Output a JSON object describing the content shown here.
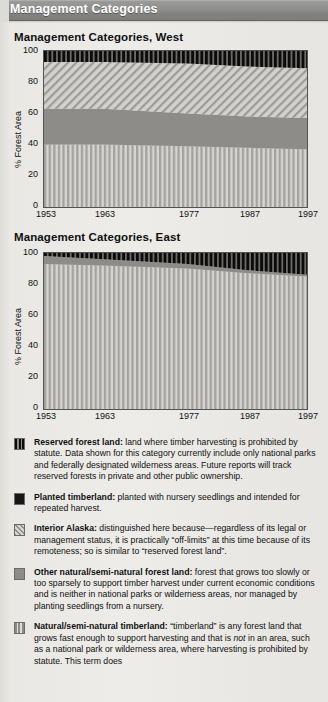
{
  "header": {
    "title": "Management Categories"
  },
  "charts": [
    {
      "id": "west",
      "title": "Management Categories, West",
      "ylabel": "% Forest Area",
      "yticks": [
        "100",
        "80",
        "60",
        "40",
        "20",
        "0"
      ],
      "xticks": [
        "1953",
        "1963",
        "1977",
        "1987",
        "1997"
      ]
    },
    {
      "id": "east",
      "title": "Management Categories, East",
      "ylabel": "% Forest Area",
      "yticks": [
        "100",
        "80",
        "60",
        "40",
        "20",
        "0"
      ],
      "xticks": [
        "1953",
        "1963",
        "1977",
        "1987",
        "1997"
      ]
    }
  ],
  "legend": [
    {
      "swatch": "reserved-forest-land-swatch",
      "pattern": "black-vertical-stripes",
      "term": "Reserved forest land:",
      "desc": " land where timber harvesting is prohibited by statute. Data shown for this category currently include only national parks and federally designated wilderness areas. Future reports will track reserved forests in  private and  other public ownership."
    },
    {
      "swatch": "planted-timberland-swatch",
      "pattern": "solid-black",
      "term": "Planted timberland:",
      "desc": " planted with nursery seedlings and intended for repeated harvest."
    },
    {
      "swatch": "interior-alaska-swatch",
      "pattern": "diagonal-hatch",
      "term": "Interior Alaska:",
      "desc": " distinguished here because—regardless of its legal or management status, it is practically “off-limits” at this time because of its remoteness; so is similar to “reserved forest land”."
    },
    {
      "swatch": "other-natural-forest-land-swatch",
      "pattern": "solid-gray",
      "term": "Other natural/semi-natural forest land:",
      "desc": " forest that grows too slowly or too sparsely to support timber harvest under current economic conditions and is neither in national parks or wilderness areas, nor managed by planting seedlings from a nursery."
    },
    {
      "swatch": "natural-semi-natural-timberland-swatch",
      "pattern": "gray-vertical-stripes",
      "term": "Natural/semi-natural timberland:",
      "desc": " “timberland” is any forest land that grows fast enough to support harvesting and that is not in an area, such as a national park or wilderness area, where harvesting is prohibited by statute. This term does not imply that harvesting is being, will be, or should be carried out. On “natural and semi-natural” lands, new trees grow from seeds from nearby trees, not from planted seedlings.",
      "italic_word": "not"
    }
  ],
  "chart_data": [
    {
      "type": "area",
      "id": "west",
      "title": "Management Categories, West",
      "xlabel": "",
      "ylabel": "% Forest Area",
      "ylim": [
        0,
        100
      ],
      "grid": false,
      "legend_position": "below-figure",
      "x": [
        1953,
        1963,
        1977,
        1987,
        1997
      ],
      "x_fractions": [
        0.0,
        0.225,
        0.545,
        0.775,
        1.0
      ],
      "stacking": "cumulative-from-bottom",
      "series": [
        {
          "name": "Natural/semi-natural timberland",
          "values": [
            40,
            40,
            39,
            38,
            37
          ]
        },
        {
          "name": "Other natural/semi-natural forest land",
          "values": [
            23,
            23,
            21,
            20,
            20
          ]
        },
        {
          "name": "Interior Alaska",
          "values": [
            30,
            30,
            32,
            32,
            32
          ]
        },
        {
          "name": "Reserved forest land",
          "values": [
            7,
            7,
            8,
            10,
            11
          ]
        }
      ]
    },
    {
      "type": "area",
      "id": "east",
      "title": "Management Categories, East",
      "xlabel": "",
      "ylabel": "% Forest Area",
      "ylim": [
        0,
        100
      ],
      "grid": false,
      "legend_position": "below-figure",
      "x": [
        1953,
        1963,
        1977,
        1987,
        1997
      ],
      "x_fractions": [
        0.0,
        0.225,
        0.545,
        0.775,
        1.0
      ],
      "stacking": "cumulative-from-bottom",
      "series": [
        {
          "name": "Natural/semi-natural timberland",
          "values": [
            93,
            92,
            90,
            87,
            85
          ]
        },
        {
          "name": "Other natural/semi-natural forest land",
          "values": [
            5,
            4,
            3,
            2,
            1
          ]
        },
        {
          "name": "Reserved forest land",
          "values": [
            2,
            4,
            7,
            11,
            14
          ]
        }
      ]
    }
  ]
}
